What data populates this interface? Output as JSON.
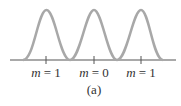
{
  "diagram": {
    "caption": "(a)",
    "labels": [
      {
        "var": "m",
        "eq": " = 1",
        "x": 46
      },
      {
        "var": "m",
        "eq": " = 0",
        "x": 94
      },
      {
        "var": "m",
        "eq": " = 1",
        "x": 141
      }
    ],
    "colors": {
      "curve": "#a8a8a8",
      "axis": "#555555",
      "text": "#333333"
    }
  }
}
